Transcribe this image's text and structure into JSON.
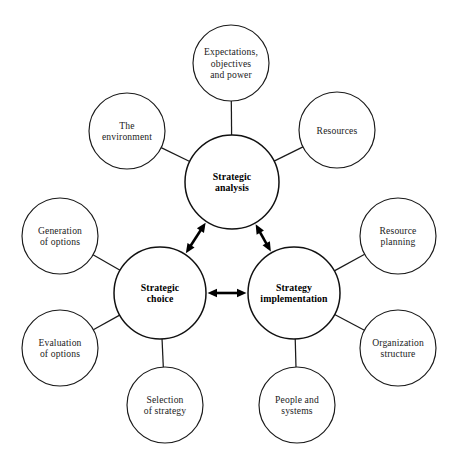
{
  "diagram": {
    "background_color": "#ffffff",
    "stroke_color": "#1a1a1a",
    "hubs": [
      {
        "id": "strategic-analysis",
        "lines": [
          "Strategic",
          "analysis"
        ],
        "cx": 232,
        "cy": 182,
        "r": 47
      },
      {
        "id": "strategic-choice",
        "lines": [
          "Strategic",
          "choice"
        ],
        "cx": 160,
        "cy": 293,
        "r": 46
      },
      {
        "id": "strategy-implementation",
        "lines": [
          "Strategy",
          "implementation"
        ],
        "cx": 294,
        "cy": 293,
        "r": 46
      }
    ],
    "satellites": [
      {
        "id": "expectations-objectives-and-power",
        "lines": [
          "Expectations,",
          "objectives",
          "and power"
        ],
        "cx": 231,
        "cy": 63,
        "r": 38,
        "hub": "strategic-analysis"
      },
      {
        "id": "the-environment",
        "lines": [
          "The",
          "environment"
        ],
        "cx": 127,
        "cy": 131,
        "r": 38,
        "hub": "strategic-analysis"
      },
      {
        "id": "resources",
        "lines": [
          "Resources"
        ],
        "cx": 337,
        "cy": 130,
        "r": 38,
        "hub": "strategic-analysis"
      },
      {
        "id": "generation-of-options",
        "lines": [
          "Generation",
          "of options"
        ],
        "cx": 60,
        "cy": 236,
        "r": 38,
        "hub": "strategic-choice"
      },
      {
        "id": "evaluation-of-options",
        "lines": [
          "Evaluation",
          "of options"
        ],
        "cx": 60,
        "cy": 348,
        "r": 38,
        "hub": "strategic-choice"
      },
      {
        "id": "selection-of-strategy",
        "lines": [
          "Selection",
          "of strategy"
        ],
        "cx": 165,
        "cy": 405,
        "r": 38,
        "hub": "strategic-choice"
      },
      {
        "id": "resource-planning",
        "lines": [
          "Resource",
          "planning"
        ],
        "cx": 398,
        "cy": 236,
        "r": 38,
        "hub": "strategy-implementation"
      },
      {
        "id": "organization-structure",
        "lines": [
          "Organization",
          "structure"
        ],
        "cx": 398,
        "cy": 348,
        "r": 38,
        "hub": "strategy-implementation"
      },
      {
        "id": "people-and-systems",
        "lines": [
          "People and",
          "systems"
        ],
        "cx": 297,
        "cy": 405,
        "r": 38,
        "hub": "strategy-implementation"
      }
    ],
    "connectors": [
      {
        "id": "analysis-choice",
        "from": "strategic-analysis",
        "to": "strategic-choice",
        "style": "double-arrow"
      },
      {
        "id": "analysis-implementation",
        "from": "strategic-analysis",
        "to": "strategy-implementation",
        "style": "double-arrow"
      },
      {
        "id": "choice-implementation",
        "from": "strategic-choice",
        "to": "strategy-implementation",
        "style": "double-arrow"
      }
    ]
  }
}
